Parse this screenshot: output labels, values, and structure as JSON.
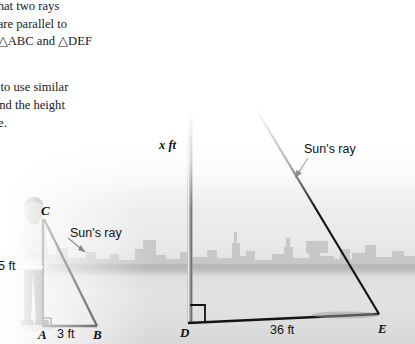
{
  "page": {
    "width": 415,
    "height": 344,
    "kind": "textbook-figure-similar-triangles"
  },
  "body_text": {
    "paragraph1_lines": [
      "ct that two rays",
      "un are parallel to",
      "ny △ABC and △DEF",
      "."
    ],
    "paragraph2_lines": [
      "ow to use similar",
      "o find the height",
      "pole."
    ],
    "triangle_abc": "△ABC",
    "triangle_def": "△DEF"
  },
  "figure": {
    "small_triangle": {
      "vertex_top_label": "C",
      "vertex_left_label": "A",
      "vertex_right_label": "B",
      "height_label": "5 ft",
      "base_label": "3 ft",
      "ray_label": "Sun's ray",
      "right_angle_at": "A"
    },
    "large_triangle": {
      "vertex_left_label": "D",
      "vertex_right_label": "E",
      "height_label": "x ft",
      "base_label": "36 ft",
      "ray_label": "Sun's ray",
      "right_angle_at": "D"
    },
    "objects": {
      "flag": "united-states-flag",
      "flagpole": "flagpole",
      "person": "standing-person",
      "skyline": "city-skyline"
    }
  },
  "colors": {
    "ink": "#111111",
    "line": "#1a1a1a",
    "sky": "#ffffff",
    "water": "#dedede",
    "skyline": "#c9c9c9",
    "flag_dark": "#3a3a3a",
    "flag_light": "#f2f2f2"
  }
}
